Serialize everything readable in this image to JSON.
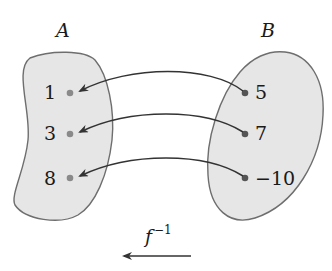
{
  "diagram": {
    "type": "function-mapping",
    "sets": [
      {
        "id": "A",
        "label": "A",
        "elements": [
          "1",
          "3",
          "8"
        ]
      },
      {
        "id": "B",
        "label": "B",
        "elements": [
          "5",
          "7",
          "−10"
        ]
      }
    ],
    "mappings": [
      {
        "from": "5",
        "to": "1"
      },
      {
        "from": "7",
        "to": "3"
      },
      {
        "from": "−10",
        "to": "8"
      }
    ],
    "function_label": {
      "base": "f",
      "superscript": "−1"
    },
    "direction_arrow": "right-to-left",
    "colors": {
      "set_fill": "#e6e6e6",
      "set_stroke": "#6e6e6e",
      "arrow": "#333333",
      "dot_left": "#8a8a8a",
      "dot_right": "#555555",
      "text": "#1a1a1a"
    }
  }
}
